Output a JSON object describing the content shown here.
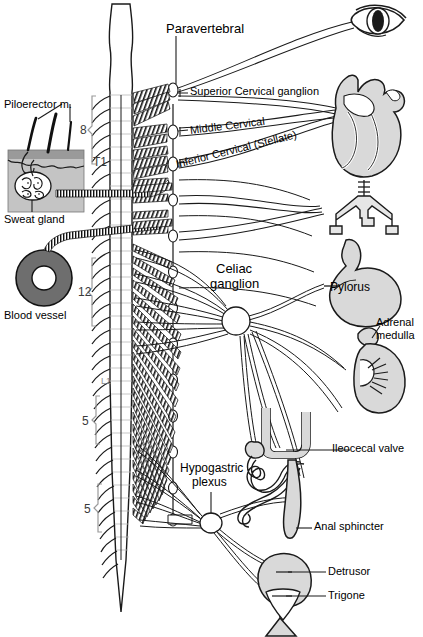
{
  "figure": {
    "width": 423,
    "height": 637,
    "background": "#ffffff"
  },
  "palette": {
    "outline": "#1a1a1a",
    "organ_fill": "#d9d9d9",
    "organ_fill_light": "#e6e6e6",
    "epidermis": "#9a9a9a",
    "dermis": "#c4c4c4",
    "vessel_wall": "#6e6e6e",
    "vessel_lumen": "#ffffff",
    "nerve_line": "#2b2b2b",
    "bracket": "#9a9a9a",
    "segment_text": "#3a3a3a"
  },
  "labels": {
    "paravertebral": "Paravertebral",
    "superior_cervical": "Superior Cervical ganglion",
    "middle_cervical": "Middle Cervical",
    "inferior_cervical": "Inferior Cervical (Stellate)",
    "celiac_ganglion": "Celiac\nganglion",
    "celiac_line1": "Celiac",
    "celiac_line2": "ganglion",
    "pylorus": "Pylorus",
    "adrenal_medulla": "Adrenal\nmedulla",
    "adrenal_line1": "Adrenal",
    "adrenal_line2": "medulla",
    "ileocecal_valve": "Ileocecal valve",
    "anal_sphincter": "Anal sphincter",
    "hypogastric_plexus": "Hypogastric\nplexus",
    "hypogastric_line1": "Hypogastric",
    "hypogastric_line2": "plexus",
    "detrusor": "Detrusor",
    "trigone": "Trigone",
    "piloerector": "Piloerector m.",
    "sweat_gland": "Sweat gland",
    "blood_vessel": "Blood vessel"
  },
  "spinal_segments": [
    {
      "id": "thoracic-count",
      "text": "8",
      "meaning": "eight upper thoracic segments"
    },
    {
      "id": "t1-marker",
      "text": "T1",
      "meaning": "first thoracic segment"
    },
    {
      "id": "thoracolumbar-count",
      "text": "12",
      "meaning": "twelve thoracic segments"
    },
    {
      "id": "l1-marker",
      "text": "L1",
      "meaning": "first lumbar segment"
    },
    {
      "id": "lumbar-count",
      "text": "5",
      "meaning": "five lumbar segments"
    },
    {
      "id": "sacral-count",
      "text": "5",
      "meaning": "five sacral segments"
    }
  ],
  "organs": [
    {
      "name": "eye",
      "label": ""
    },
    {
      "name": "heart",
      "label": ""
    },
    {
      "name": "trachea-bronchi",
      "label": ""
    },
    {
      "name": "stomach",
      "label": "Pylorus"
    },
    {
      "name": "kidney-adrenal",
      "label": "Adrenal medulla"
    },
    {
      "name": "intestine",
      "label": "Ileocecal valve"
    },
    {
      "name": "rectum",
      "label": "Anal sphincter"
    },
    {
      "name": "bladder",
      "label": "Detrusor / Trigone"
    },
    {
      "name": "skin-block",
      "label": "Piloerector m. / Sweat gland"
    },
    {
      "name": "blood-vessel",
      "label": "Blood vessel"
    }
  ],
  "ganglia": [
    {
      "name": "superior-cervical-ganglion",
      "label": "Superior Cervical ganglion"
    },
    {
      "name": "middle-cervical-ganglion",
      "label": "Middle Cervical"
    },
    {
      "name": "inferior-cervical-ganglion",
      "label": "Inferior Cervical (Stellate)"
    },
    {
      "name": "celiac-ganglion",
      "label": "Celiac ganglion"
    },
    {
      "name": "hypogastric-plexus",
      "label": "Hypogastric plexus"
    }
  ]
}
